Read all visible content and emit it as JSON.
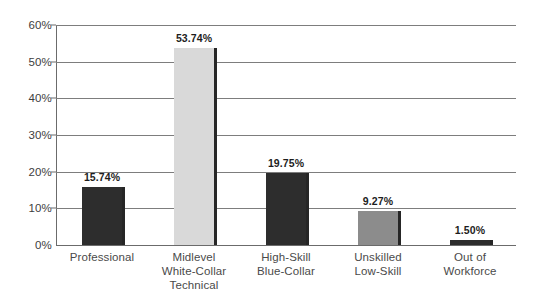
{
  "chart_data": {
    "type": "bar",
    "title": "",
    "subtitle": "",
    "xlabel": "",
    "ylabel": "",
    "ylim": [
      0,
      60
    ],
    "grid": true,
    "legend": false,
    "y_ticks": [
      "0%",
      "10%",
      "20%",
      "30%",
      "40%",
      "50%",
      "60%"
    ],
    "y_tick_values": [
      0,
      10,
      20,
      30,
      40,
      50,
      60
    ],
    "categories": [
      "Professional",
      "Midlevel White-Collar Technical",
      "High-Skill Blue-Collar",
      "Unskilled Low-Skill",
      "Out of Workforce"
    ],
    "category_lines": [
      [
        "Professional"
      ],
      [
        "Midlevel",
        "White-Collar",
        "Technical"
      ],
      [
        "High-Skill",
        "Blue-Collar"
      ],
      [
        "Unskilled",
        "Low-Skill"
      ],
      [
        "Out of",
        "Workforce"
      ]
    ],
    "values": [
      15.74,
      53.74,
      19.75,
      9.27,
      1.5
    ],
    "data_labels": [
      "15.74%",
      "53.74%",
      "19.75%",
      "9.27%",
      "1.50%"
    ],
    "bar_colors": [
      "#2d2d2d",
      "#d9d9d9",
      "#2d2d2d",
      "#8c8c8c",
      "#2d2d2d"
    ],
    "bar_edge_color": "#262626",
    "axis_color": "#6b6b6b",
    "gridline_color": "#7d7d7d",
    "background_color": "#ffffff",
    "text_color": "#4a4a4a"
  }
}
